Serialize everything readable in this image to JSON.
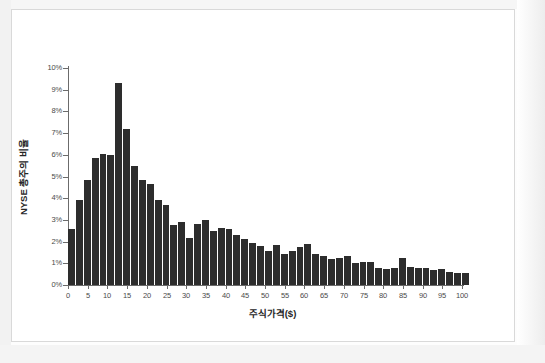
{
  "chart_data": {
    "type": "bar",
    "title": "",
    "subtitle": "",
    "xlabel": "주식가격($)",
    "ylabel": "NYSE 총주의 비율",
    "xlim": [
      0,
      100
    ],
    "ylim": [
      0,
      10
    ],
    "grid": false,
    "legend": null,
    "bar_color": "#2d2d2d",
    "background_color": "#ffffff",
    "axis_color": "#6b6b6b",
    "y_tick_labels": [
      "0%",
      "1%",
      "2%",
      "3%",
      "4%",
      "5%",
      "6%",
      "7%",
      "8%",
      "9%",
      "10%"
    ],
    "y_tick_values": [
      0,
      1,
      2,
      3,
      4,
      5,
      6,
      7,
      8,
      9,
      10
    ],
    "x_tick_labels": [
      "0",
      "5",
      "10",
      "15",
      "20",
      "25",
      "30",
      "35",
      "40",
      "45",
      "50",
      "55",
      "60",
      "65",
      "70",
      "75",
      "80",
      "85",
      "90",
      "95",
      "100"
    ],
    "x_tick_values": [
      0,
      5,
      10,
      15,
      20,
      25,
      30,
      35,
      40,
      45,
      50,
      55,
      60,
      65,
      70,
      75,
      80,
      85,
      90,
      95,
      100
    ],
    "bin_width": 2,
    "x": [
      0,
      2,
      4,
      6,
      8,
      10,
      12,
      14,
      16,
      18,
      20,
      22,
      24,
      26,
      28,
      30,
      32,
      34,
      36,
      38,
      40,
      42,
      44,
      46,
      48,
      50,
      52,
      54,
      56,
      58,
      60,
      62,
      64,
      66,
      68,
      70,
      72,
      74,
      76,
      78,
      80,
      82,
      84,
      86,
      88,
      90,
      92,
      94,
      96,
      98,
      100
    ],
    "values": [
      2.6,
      3.9,
      4.85,
      5.85,
      6.05,
      6.0,
      9.3,
      7.2,
      5.5,
      4.85,
      4.65,
      3.9,
      3.7,
      2.75,
      2.9,
      2.15,
      2.8,
      3.0,
      2.5,
      2.65,
      2.6,
      2.3,
      2.1,
      1.95,
      1.8,
      1.55,
      1.85,
      1.45,
      1.55,
      1.75,
      1.9,
      1.45,
      1.35,
      1.2,
      1.25,
      1.35,
      1.0,
      1.05,
      1.05,
      0.8,
      0.75,
      0.8,
      1.25,
      0.85,
      0.8,
      0.8,
      0.7,
      0.75,
      0.6,
      0.55,
      0.55
    ],
    "peak": {
      "x": 12,
      "value": 9.3
    },
    "units": "percent"
  },
  "figure": {
    "frame": true,
    "frame_color": "#d9d9d9"
  }
}
